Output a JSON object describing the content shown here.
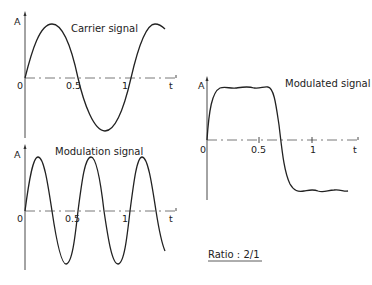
{
  "carrier": {
    "title": "Carrier signal",
    "y_label": "A",
    "x_label": "t",
    "ticks": [
      "0",
      "0.5",
      "1"
    ]
  },
  "modulation": {
    "title": "Modulation signal",
    "y_label": "A",
    "x_label": "t",
    "ticks": [
      "0",
      "0.5",
      "1"
    ]
  },
  "modulated": {
    "title": "Modulated signal",
    "y_label": "A",
    "x_label": "t",
    "ticks": [
      "0",
      "0.5",
      "1"
    ]
  },
  "ratio_label": "Ratio : 2/1",
  "colors": {
    "line": "#222222",
    "axis": "#333333",
    "background": "#ffffff"
  }
}
